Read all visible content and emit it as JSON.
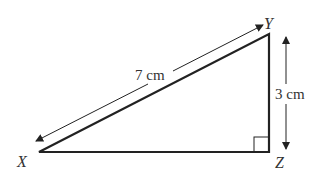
{
  "diagram": {
    "type": "right-triangle",
    "vertices": {
      "X": {
        "label": "X",
        "x": 39,
        "y": 152
      },
      "Y": {
        "label": "Y",
        "x": 269,
        "y": 34
      },
      "Z": {
        "label": "Z",
        "x": 269,
        "y": 152
      }
    },
    "right_angle_at": "Z",
    "measurements": {
      "hypotenuse_XY": "7 cm",
      "side_YZ": "3 cm"
    },
    "colors": {
      "line": "#222222",
      "text": "#333333",
      "background": "#ffffff"
    }
  }
}
